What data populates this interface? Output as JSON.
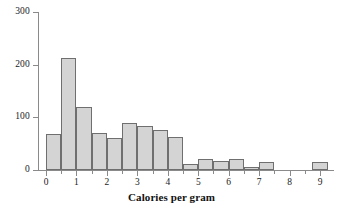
{
  "chart_data": {
    "type": "bar",
    "title": "",
    "subtitle": "",
    "xlabel": "Calories per gram",
    "ylabel": "",
    "xlim": [
      -0.25,
      9.4
    ],
    "ylim": [
      0,
      300
    ],
    "grid": false,
    "legend": null,
    "bin_width": 0.5,
    "x_ticks": [
      0,
      1,
      2,
      3,
      4,
      5,
      6,
      7,
      8,
      9
    ],
    "x_tick_labels": [
      "0",
      "1",
      "2",
      "3",
      "4",
      "5",
      "6",
      "7",
      "8",
      "9"
    ],
    "x_minor_ticks": [
      0.5,
      1.5,
      2.5,
      3.5,
      4.5,
      5.5,
      6.5,
      7.5,
      8.5
    ],
    "y_ticks": [
      0,
      100,
      200,
      300
    ],
    "y_tick_labels": [
      "0",
      "100",
      "200",
      "300"
    ],
    "bars": [
      {
        "bin_start": 0.0,
        "bin_end": 0.5,
        "value": 68
      },
      {
        "bin_start": 0.5,
        "bin_end": 1.0,
        "value": 212
      },
      {
        "bin_start": 1.0,
        "bin_end": 1.5,
        "value": 120
      },
      {
        "bin_start": 1.5,
        "bin_end": 2.0,
        "value": 71
      },
      {
        "bin_start": 2.0,
        "bin_end": 2.5,
        "value": 60
      },
      {
        "bin_start": 2.5,
        "bin_end": 3.0,
        "value": 89
      },
      {
        "bin_start": 3.0,
        "bin_end": 3.5,
        "value": 84
      },
      {
        "bin_start": 3.5,
        "bin_end": 4.0,
        "value": 76
      },
      {
        "bin_start": 4.0,
        "bin_end": 4.5,
        "value": 62
      },
      {
        "bin_start": 4.5,
        "bin_end": 5.0,
        "value": 12
      },
      {
        "bin_start": 5.0,
        "bin_end": 5.5,
        "value": 21
      },
      {
        "bin_start": 5.5,
        "bin_end": 6.0,
        "value": 17
      },
      {
        "bin_start": 6.0,
        "bin_end": 6.5,
        "value": 20
      },
      {
        "bin_start": 6.5,
        "bin_end": 7.0,
        "value": 5
      },
      {
        "bin_start": 7.0,
        "bin_end": 7.5,
        "value": 15
      },
      {
        "bin_start": 8.75,
        "bin_end": 9.25,
        "value": 15
      }
    ],
    "colors": {
      "bar_fill": "#d4d4d4",
      "bar_stroke": "#6f6f6f",
      "axis": "#8a8a8a",
      "text": "#1a1a1a",
      "background": "#ffffff"
    }
  }
}
